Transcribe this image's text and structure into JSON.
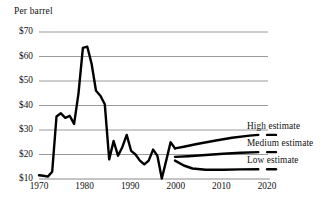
{
  "chart_data": {
    "type": "line",
    "title": "Per barrel",
    "xlabel": "",
    "ylabel": "",
    "xlim": [
      1970,
      2022
    ],
    "ylim": [
      10,
      70
    ],
    "grid": true,
    "legend_position": "right-inline",
    "x_ticks": [
      "1970",
      "1980",
      "1990",
      "2000",
      "2010",
      "2020"
    ],
    "x_tick_values": [
      1970,
      1980,
      1990,
      2000,
      2010,
      2020
    ],
    "y_ticks": [
      "$10",
      "$20",
      "$30",
      "$40",
      "$50",
      "$60",
      "$70"
    ],
    "y_tick_values": [
      10,
      20,
      30,
      40,
      50,
      60,
      70
    ],
    "series": [
      {
        "name": "Historical",
        "label": "",
        "x": [
          1970,
          1971,
          1972,
          1973,
          1974,
          1975,
          1976,
          1977,
          1978,
          1979,
          1980,
          1981,
          1982,
          1983,
          1984,
          1985,
          1986,
          1987,
          1988,
          1989,
          1990,
          1991,
          1992,
          1993,
          1994,
          1995,
          1996,
          1997,
          1998,
          1999,
          2000,
          2001
        ],
        "values": [
          11.5,
          11.3,
          11.0,
          13.0,
          35.5,
          36.8,
          35.0,
          35.8,
          32.5,
          45.0,
          63.5,
          64.0,
          57.0,
          46.0,
          44.0,
          40.5,
          18.0,
          25.5,
          19.5,
          23.0,
          28.0,
          21.5,
          20.0,
          17.5,
          16.0,
          17.5,
          22.0,
          19.5,
          10.2,
          17.5,
          25.0,
          22.5
        ]
      },
      {
        "name": "High estimate",
        "label": "High estimate",
        "x": [
          2001,
          2003,
          2006,
          2010,
          2014,
          2018,
          2020
        ],
        "values": [
          22.5,
          23.2,
          24.3,
          25.6,
          26.8,
          27.7,
          28.0
        ]
      },
      {
        "name": "Medium estimate",
        "label": "Medium estimate",
        "x": [
          2001,
          2004,
          2008,
          2012,
          2016,
          2020
        ],
        "values": [
          19.0,
          19.3,
          19.8,
          20.3,
          20.7,
          21.0
        ]
      },
      {
        "name": "Low estimate",
        "label": "Low estimate",
        "x": [
          2001,
          2003,
          2005,
          2008,
          2012,
          2016,
          2020
        ],
        "values": [
          17.5,
          15.5,
          14.3,
          13.8,
          13.8,
          13.9,
          14.0
        ]
      }
    ],
    "colors": {
      "line": "#000000",
      "grid": "#9a9a9a",
      "axis": "#6e6e6e",
      "text": "#111111",
      "background": "#ffffff"
    }
  },
  "axes": {
    "y_labels": [
      "$70",
      "$60",
      "$50",
      "$40",
      "$30",
      "$20",
      "$10"
    ],
    "x_labels": [
      "1970",
      "1980",
      "1990",
      "2000",
      "2010",
      "2020"
    ]
  },
  "legend": {
    "high": "High estimate",
    "medium": "Medium estimate",
    "low": "Low estimate"
  }
}
